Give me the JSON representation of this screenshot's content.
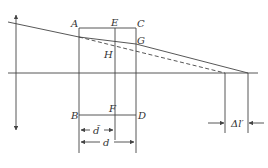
{
  "diagram": {
    "points": {
      "A": "A",
      "E": "E",
      "C": "C",
      "G": "G",
      "H": "H",
      "B": "B",
      "F": "F",
      "D": "D"
    },
    "dimensions": {
      "d_bar": "d̄",
      "d": "d",
      "delta_l_prime": "Δl′"
    },
    "colors": {
      "line": "#444444",
      "text": "#333333",
      "background": "#ffffff"
    }
  }
}
